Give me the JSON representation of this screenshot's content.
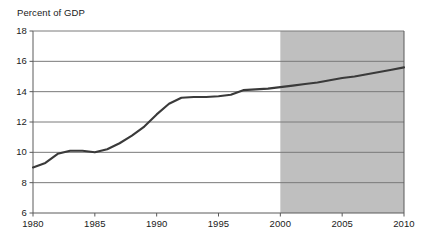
{
  "chart_data": {
    "type": "line",
    "title": "Percent of GDP",
    "xlabel": "",
    "ylabel": "Percent of GDP",
    "xlim": [
      1980,
      2010
    ],
    "ylim": [
      6,
      18
    ],
    "grid": true,
    "legend": "none",
    "y_ticks": [
      18,
      16,
      14,
      12,
      10,
      8,
      6
    ],
    "x_ticks": [
      1980,
      1985,
      1990,
      1995,
      2000,
      2010
    ],
    "x_tick_labels": [
      "1980",
      "1985",
      "1990",
      "1995",
      "2000",
      "2005",
      "2010"
    ],
    "x_tick_values": [
      1980,
      1985,
      1990,
      1995,
      2000,
      2005,
      2010
    ],
    "y_tick_labels": [
      "18",
      "16",
      "14",
      "12",
      "10",
      "8",
      "6"
    ],
    "series": [
      {
        "name": "Percent of GDP",
        "color": "#3a3a3a",
        "x": [
          1980,
          1981,
          1982,
          1983,
          1984,
          1985,
          1986,
          1987,
          1988,
          1989,
          1990,
          1991,
          1992,
          1993,
          1994,
          1995,
          1996,
          1997,
          1998,
          1999,
          2000,
          2001,
          2002,
          2003,
          2004,
          2005,
          2006,
          2007,
          2008,
          2009,
          2010
        ],
        "values": [
          9.0,
          9.3,
          9.9,
          10.1,
          10.1,
          10.0,
          10.2,
          10.6,
          11.1,
          11.7,
          12.5,
          13.2,
          13.6,
          13.65,
          13.65,
          13.7,
          13.8,
          14.1,
          14.15,
          14.2,
          14.3,
          14.4,
          14.5,
          14.6,
          14.75,
          14.9,
          15.0,
          15.15,
          15.3,
          15.45,
          15.6
        ]
      }
    ],
    "annotations": [
      {
        "name": "projection-shading",
        "type": "vspan",
        "x_start": 2000,
        "x_end": 2010,
        "color": "#bfbfbf"
      }
    ]
  },
  "colors": {
    "line": "#3a3a3a",
    "gridline": "#7a7a7a",
    "axis": "#5a5a5a",
    "shading": "#bfbfbf",
    "background": "#ffffff",
    "text": "#1a1a1a"
  }
}
